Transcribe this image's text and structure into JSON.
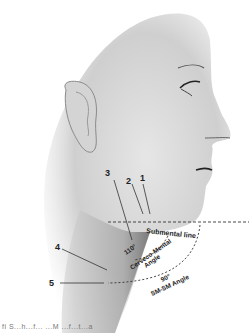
{
  "figure": {
    "labels": {
      "n1": "1",
      "n2": "2",
      "n3": "3",
      "n4": "4",
      "n5": "5",
      "submental_line": "Submental line",
      "cervicomental_angle_value": "110°",
      "cervicomental_angle_name_1": "Cerveco-Mental",
      "cervicomental_angle_name_2": "Angle",
      "smsm_angle_value": "90°",
      "smsm_angle_name": "SM-SM Angle"
    },
    "caption_fragment": "fi   S...h...f... ...M  ...f...t...a"
  }
}
